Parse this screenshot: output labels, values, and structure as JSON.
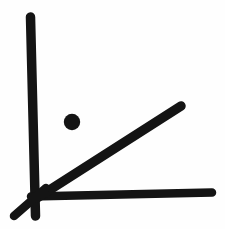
{
  "document": {
    "kind": "hand-drawn-sketch",
    "title": "Angle sketch with point",
    "width": 225,
    "height": 229
  },
  "colors": {
    "background": "#fefefe",
    "ink": "#141414",
    "ink_soft": "#1b1b1b"
  },
  "sketch": {
    "description": "Hand drawn right-angle axis pair with a diagonal ray from the origin and an isolated filled dot above the ray",
    "stroke_width_default": 9,
    "strokes": [
      {
        "name": "vertical-axis",
        "type": "line",
        "x1": 30.5,
        "y1": 17,
        "x2": 35.5,
        "y2": 216,
        "width": 9.5,
        "cap": "round"
      },
      {
        "name": "horizontal-axis",
        "type": "line",
        "x1": 31,
        "y1": 196.5,
        "x2": 212,
        "y2": 192.5,
        "width": 8.5,
        "cap": "round"
      },
      {
        "name": "diagonal-ray",
        "type": "line",
        "x1": 37,
        "y1": 198,
        "x2": 181,
        "y2": 106,
        "width": 9.5,
        "cap": "round"
      },
      {
        "name": "origin-cross-stub",
        "type": "line",
        "x1": 14,
        "y1": 216,
        "x2": 46,
        "y2": 188,
        "width": 8.5,
        "cap": "round"
      }
    ],
    "points": [
      {
        "name": "marked-point",
        "type": "dot",
        "cx": 72,
        "cy": 122,
        "r": 8.2
      }
    ]
  }
}
